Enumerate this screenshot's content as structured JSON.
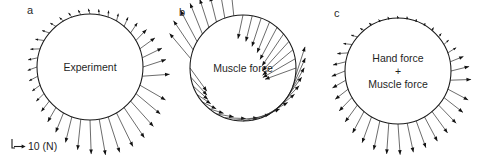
{
  "figure": {
    "width": 477,
    "height": 167,
    "background": "#ffffff",
    "stroke_color": "#3b3b3b",
    "outline_color": "#1a1a1a",
    "text_color": "#1f1f1f"
  },
  "scale_bar": {
    "label": "10 (N)",
    "x": 12,
    "y": 148,
    "arm": 9,
    "arrow_len": 11
  },
  "panels": [
    {
      "id": "a",
      "label": "a",
      "label_x": 27,
      "label_y": 14,
      "caption": "Experiment",
      "caption_lines": [
        "Experiment"
      ],
      "cx": 90,
      "cy": 67,
      "r": 53,
      "caption_x": 90,
      "caption_y": 71
    },
    {
      "id": "b",
      "label": "b",
      "label_x": 179,
      "label_y": 16,
      "caption": "Muscle force",
      "caption_lines": [
        "Muscle force"
      ],
      "cx": 243,
      "cy": 68,
      "r": 53,
      "caption_x": 243,
      "caption_y": 72
    },
    {
      "id": "c",
      "label": "c",
      "label_x": 334,
      "label_y": 17,
      "caption": "Hand force + Muscle force",
      "caption_lines": [
        "Hand force",
        "+",
        "Muscle force"
      ],
      "cx": 398,
      "cy": 71,
      "r": 53,
      "caption_x": 398,
      "caption_y": 62
    }
  ],
  "chart_data": {
    "type": "scatter",
    "title": "",
    "xlabel": "",
    "ylabel": "",
    "units": "N",
    "scale_newtons": 10,
    "scale_pixels": 11,
    "n_points_per_panel": 36,
    "panel_a": {
      "name": "Experiment",
      "angles_deg": [
        0,
        10,
        20,
        30,
        40,
        50,
        60,
        70,
        80,
        90,
        100,
        110,
        120,
        130,
        140,
        150,
        160,
        170,
        180,
        190,
        200,
        210,
        220,
        230,
        240,
        250,
        260,
        270,
        280,
        290,
        300,
        310,
        320,
        330,
        340,
        350
      ],
      "magnitudes_N": [
        22,
        20,
        17,
        14,
        11,
        9,
        7,
        6,
        5,
        5,
        5,
        5,
        5,
        6,
        7,
        8,
        9,
        9,
        9,
        9,
        9,
        10,
        12,
        15,
        19,
        24,
        28,
        31,
        33,
        34,
        34,
        33,
        31,
        29,
        27,
        25
      ],
      "direction_deg": [
        18,
        26,
        36,
        46,
        56,
        66,
        76,
        86,
        96,
        108,
        118,
        128,
        138,
        150,
        162,
        172,
        182,
        192,
        200,
        208,
        216,
        224,
        232,
        240,
        248,
        256,
        264,
        272,
        280,
        288,
        296,
        304,
        312,
        320,
        330,
        4
      ]
    },
    "panel_b": {
      "name": "Muscle force",
      "angles_deg": [
        0,
        10,
        20,
        30,
        40,
        50,
        60,
        70,
        80,
        90,
        100,
        110,
        120,
        130,
        140,
        150,
        160,
        170,
        180,
        190,
        200,
        210,
        220,
        230,
        240,
        250,
        260,
        270,
        280,
        290,
        300,
        310,
        320,
        330,
        340,
        350
      ],
      "magnitudes_N": [
        30,
        34,
        36,
        36,
        35,
        33,
        30,
        27,
        24,
        22,
        21,
        22,
        24,
        27,
        30,
        32,
        32,
        30,
        26,
        22,
        18,
        15,
        14,
        14,
        16,
        19,
        22,
        25,
        27,
        28,
        29,
        29,
        28,
        28,
        28,
        29
      ],
      "direction_deg": [
        200,
        210,
        220,
        228,
        236,
        242,
        248,
        252,
        256,
        258,
        96,
        100,
        104,
        108,
        112,
        118,
        124,
        130,
        306,
        312,
        318,
        326,
        334,
        342,
        350,
        358,
        6,
        14,
        22,
        30,
        38,
        46,
        54,
        60,
        66,
        72
      ]
    },
    "panel_c": {
      "name": "Hand force + Muscle force",
      "angles_deg": [
        0,
        10,
        20,
        30,
        40,
        50,
        60,
        70,
        80,
        90,
        100,
        110,
        120,
        130,
        140,
        150,
        160,
        170,
        180,
        190,
        200,
        210,
        220,
        230,
        240,
        250,
        260,
        270,
        280,
        290,
        300,
        310,
        320,
        330,
        340,
        350
      ],
      "magnitudes_N": [
        17,
        13,
        9,
        6,
        4,
        3,
        2,
        2,
        2,
        2,
        2,
        2,
        3,
        4,
        6,
        8,
        10,
        12,
        13,
        14,
        15,
        17,
        19,
        22,
        25,
        27,
        28,
        28,
        27,
        26,
        25,
        24,
        23,
        22,
        21,
        19
      ],
      "direction_deg": [
        14,
        22,
        32,
        42,
        52,
        64,
        74,
        86,
        96,
        108,
        118,
        128,
        140,
        152,
        164,
        174,
        184,
        194,
        202,
        210,
        218,
        226,
        234,
        242,
        250,
        258,
        266,
        274,
        282,
        290,
        298,
        306,
        314,
        322,
        332,
        2
      ]
    }
  }
}
